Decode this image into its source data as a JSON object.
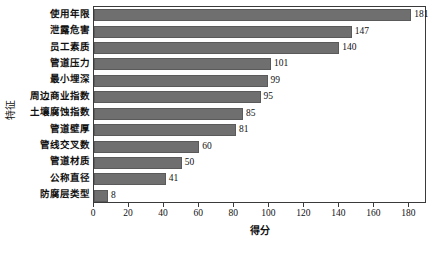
{
  "chart_data": {
    "type": "bar",
    "orientation": "horizontal",
    "title": "",
    "xlabel": "得分",
    "ylabel": "特征",
    "xlim": [
      0,
      190
    ],
    "ylim": null,
    "grid": false,
    "legend": null,
    "bar_color": "#6f6f6f",
    "xticks": [
      0,
      20,
      40,
      60,
      80,
      100,
      120,
      140,
      160,
      180
    ],
    "categories": [
      "使用年限",
      "泄露危害",
      "员工素质",
      "管道压力",
      "最小埋深",
      "周边商业指数",
      "土壤腐蚀指数",
      "管道壁厚",
      "管线交叉数",
      "管道材质",
      "公称直径",
      "防腐层类型"
    ],
    "values": [
      181,
      147,
      140,
      101,
      99,
      95,
      85,
      81,
      60,
      50,
      41,
      8
    ],
    "data_labels": [
      "181",
      "147",
      "140",
      "101",
      "99",
      "95",
      "85",
      "81",
      "60",
      "50",
      "41",
      "8"
    ]
  }
}
